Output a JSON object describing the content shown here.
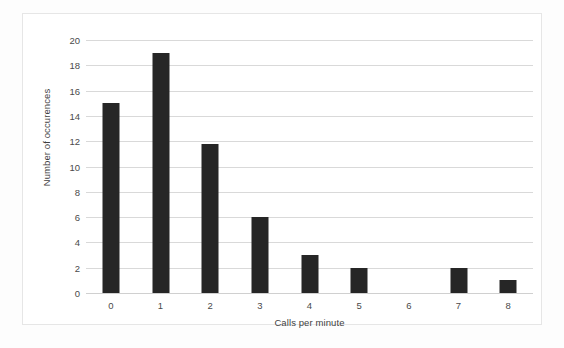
{
  "chart_data": {
    "type": "bar",
    "title": "",
    "xlabel": "Calls per minute",
    "ylabel": "Number of occurences",
    "categories": [
      "0",
      "1",
      "2",
      "3",
      "4",
      "5",
      "6",
      "7",
      "8"
    ],
    "values": [
      15,
      19,
      11.8,
      6,
      3,
      2,
      0,
      2,
      1
    ],
    "ylim": [
      0,
      20
    ],
    "yticks": [
      "0",
      "2",
      "4",
      "6",
      "8",
      "10",
      "12",
      "14",
      "16",
      "18",
      "20"
    ],
    "ytick_values": [
      0,
      2,
      4,
      6,
      8,
      10,
      12,
      14,
      16,
      18,
      20
    ],
    "xticks": [
      "0",
      "1",
      "2",
      "3",
      "4",
      "5",
      "6",
      "7",
      "8"
    ],
    "grid": "horizontal",
    "legend": "none",
    "bar_color": "#262626",
    "grid_color": "#d9d9d9",
    "plot_background": "#ffffff",
    "frame_border_color": "#e6e6e6"
  }
}
